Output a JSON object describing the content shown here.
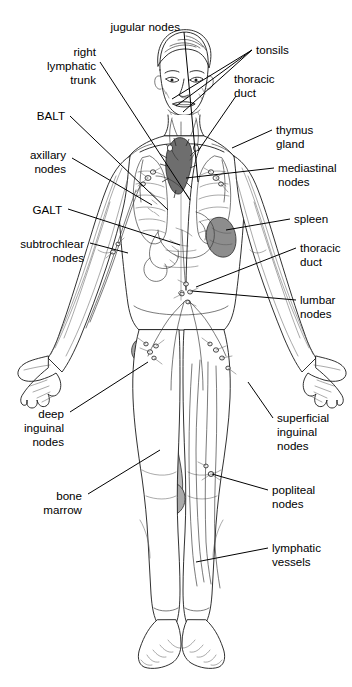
{
  "diagram": {
    "background_color": "#ffffff",
    "ink_color": "#1a1a1a",
    "organ_colors": {
      "thymus_gland": "#6e6e6e",
      "spleen": "#8d8d8d",
      "bone_marrow": "#b8b8b8",
      "femur_head": "#a9a9a9",
      "pelvis_shade": "#c9c9c9"
    }
  },
  "labels": {
    "left": [
      {
        "id": "jugular-nodes",
        "text": "jugular nodes",
        "lines": [
          "jugular nodes"
        ],
        "x": 180,
        "y": 27,
        "anchor": "end"
      },
      {
        "id": "right-lymphatic-trunk",
        "text": "right lymphatic trunk",
        "lines": [
          "right",
          "lymphatic",
          "trunk"
        ],
        "x": 96,
        "y": 66,
        "anchor": "end"
      },
      {
        "id": "balt",
        "text": "BALT",
        "lines": [
          "BALT"
        ],
        "x": 65,
        "y": 118,
        "anchor": "end"
      },
      {
        "id": "axillary-nodes",
        "text": "axillary nodes",
        "lines": [
          "axillary",
          "nodes"
        ],
        "x": 66,
        "y": 162,
        "anchor": "end"
      },
      {
        "id": "galt",
        "text": "GALT",
        "lines": [
          "GALT"
        ],
        "x": 62,
        "y": 212,
        "anchor": "end"
      },
      {
        "id": "subtrochlear-nodes",
        "text": "subtrochlear nodes",
        "lines": [
          "subtrochlear",
          "nodes"
        ],
        "x": 84,
        "y": 249,
        "anchor": "end"
      },
      {
        "id": "deep-inguinal-nodes",
        "text": "deep inguinal nodes",
        "lines": [
          "deep",
          "inguinal",
          "nodes"
        ],
        "x": 64,
        "y": 418,
        "anchor": "end"
      },
      {
        "id": "bone-marrow",
        "text": "bone marrow",
        "lines": [
          "bone",
          "marrow"
        ],
        "x": 82,
        "y": 498,
        "anchor": "end"
      }
    ],
    "right": [
      {
        "id": "tonsils",
        "text": "tonsils",
        "lines": [
          "tonsils"
        ],
        "x": 256,
        "y": 53,
        "anchor": "start"
      },
      {
        "id": "thoracic-duct-upper",
        "text": "thoracic duct",
        "lines": [
          "thoracic",
          "duct"
        ],
        "x": 234,
        "y": 80,
        "anchor": "start"
      },
      {
        "id": "thymus-gland",
        "text": "thymus gland",
        "lines": [
          "thymus",
          "gland"
        ],
        "x": 276,
        "y": 134,
        "anchor": "start"
      },
      {
        "id": "mediastinal-nodes",
        "text": "mediastinal nodes",
        "lines": [
          "mediastinal",
          "nodes"
        ],
        "x": 278,
        "y": 172,
        "anchor": "start"
      },
      {
        "id": "spleen",
        "text": "spleen",
        "lines": [
          "spleen"
        ],
        "x": 294,
        "y": 222,
        "anchor": "start"
      },
      {
        "id": "thoracic-duct-lower",
        "text": "thoracic duct",
        "lines": [
          "thoracic",
          "duct"
        ],
        "x": 300,
        "y": 251,
        "anchor": "start"
      },
      {
        "id": "lumbar-nodes",
        "text": "lumbar nodes",
        "lines": [
          "lumbar",
          "nodes"
        ],
        "x": 300,
        "y": 303,
        "anchor": "start"
      },
      {
        "id": "superficial-inguinal-nodes",
        "text": "superficial inguinal nodes",
        "lines": [
          "superficial",
          "inguinal",
          "nodes"
        ],
        "x": 277,
        "y": 422,
        "anchor": "start"
      },
      {
        "id": "popliteal-nodes",
        "text": "popliteal nodes",
        "lines": [
          "popliteal",
          "nodes"
        ],
        "x": 272,
        "y": 493,
        "anchor": "start"
      },
      {
        "id": "lymphatic-vessels",
        "text": "lymphatic vessels",
        "lines": [
          "lymphatic",
          "vessels"
        ],
        "x": 272,
        "y": 551,
        "anchor": "start"
      }
    ]
  },
  "leaders": {
    "jugular_nodes": [
      [
        184,
        32
      ],
      [
        198,
        182
      ]
    ],
    "right_lymphatic_trunk": [
      [
        100,
        62
      ],
      [
        190,
        200
      ]
    ],
    "balt": [
      [
        70,
        116
      ],
      [
        168,
        210
      ]
    ],
    "axillary_nodes": [
      [
        72,
        158
      ],
      [
        152,
        205
      ]
    ],
    "galt": [
      [
        68,
        209
      ],
      [
        180,
        245
      ]
    ],
    "subtrochlear_nodes": [
      [
        90,
        243
      ],
      [
        128,
        253
      ]
    ],
    "deep_inguinal_nodes": [
      [
        70,
        412
      ],
      [
        148,
        362
      ]
    ],
    "bone_marrow": [
      [
        88,
        494
      ],
      [
        160,
        450
      ]
    ],
    "tonsils_a": [
      [
        252,
        50
      ],
      [
        172,
        99
      ]
    ],
    "tonsils_b": [
      [
        252,
        50
      ],
      [
        176,
        104
      ]
    ],
    "tonsils_c": [
      [
        252,
        50
      ],
      [
        182,
        110
      ]
    ],
    "thoracic_duct_upper": [
      [
        236,
        96
      ],
      [
        198,
        151
      ]
    ],
    "thymus_gland": [
      [
        272,
        130
      ],
      [
        232,
        148
      ]
    ],
    "mediastinal_nodes": [
      [
        274,
        168
      ],
      [
        186,
        178
      ]
    ],
    "spleen": [
      [
        290,
        219
      ],
      [
        226,
        230
      ]
    ],
    "thoracic_duct_lower": [
      [
        296,
        248
      ],
      [
        196,
        287
      ]
    ],
    "lumbar_nodes": [
      [
        296,
        300
      ],
      [
        192,
        291
      ]
    ],
    "superficial_inguinal_nodes": [
      [
        273,
        418
      ],
      [
        248,
        382
      ]
    ],
    "popliteal_nodes": [
      [
        268,
        490
      ],
      [
        212,
        474
      ]
    ],
    "lymphatic_vessels": [
      [
        268,
        548
      ],
      [
        196,
        562
      ]
    ]
  },
  "anatomy_parts": [
    {
      "id": "head",
      "name": "head and face"
    },
    {
      "id": "neck",
      "name": "neck"
    },
    {
      "id": "torso",
      "name": "torso"
    },
    {
      "id": "left-arm",
      "name": "left arm and hand"
    },
    {
      "id": "right-arm",
      "name": "right arm and hand"
    },
    {
      "id": "legs",
      "name": "legs and feet"
    },
    {
      "id": "thymus",
      "name": "thymus gland"
    },
    {
      "id": "spleen",
      "name": "spleen"
    },
    {
      "id": "lungs",
      "name": "lungs"
    },
    {
      "id": "stomach",
      "name": "stomach and intestine"
    },
    {
      "id": "femur",
      "name": "femur with bone marrow"
    },
    {
      "id": "lymph-network",
      "name": "lymphatic vessel network"
    }
  ]
}
